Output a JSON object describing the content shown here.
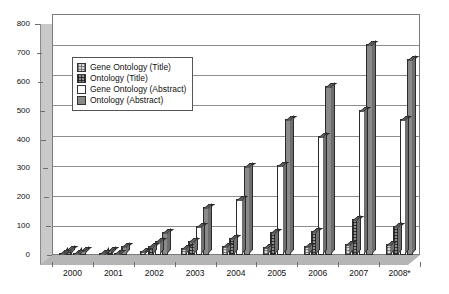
{
  "chart_data": {
    "type": "bar",
    "title": "",
    "xlabel": "",
    "ylabel": "",
    "ylim": [
      0,
      800
    ],
    "ytick_step": 100,
    "yticks": [
      "800",
      "700",
      "600",
      "500",
      "400",
      "300",
      "200",
      "100",
      "0"
    ],
    "grid": true,
    "legend_position": "upper-left-inside",
    "categories": [
      "2000",
      "2001",
      "2002",
      "2003",
      "2004",
      "2005",
      "2006",
      "2007",
      "2008*"
    ],
    "series": [
      {
        "name": "Gene Ontology (Title)",
        "fill": "light-checker",
        "values": [
          6,
          5,
          12,
          22,
          30,
          28,
          30,
          38,
          35
        ]
      },
      {
        "name": "Ontology (Title)",
        "fill": "dark-checker",
        "values": [
          20,
          18,
          30,
          48,
          58,
          78,
          80,
          118,
          95
        ]
      },
      {
        "name": "Gene Ontology (Abstract)",
        "fill": "white",
        "values": [
          5,
          8,
          45,
          95,
          185,
          300,
          395,
          480,
          450
        ]
      },
      {
        "name": "Ontology (Abstract)",
        "fill": "solid-gray",
        "values": [
          15,
          30,
          75,
          160,
          295,
          450,
          560,
          700,
          650
        ]
      }
    ]
  },
  "colors": {
    "axis": "#7a7a7a",
    "gridline": "#8d8d8d",
    "bar_outline": "#2b2b2b",
    "series_light_checker": "#d8d8d8",
    "series_dark_checker": "#8e8e8e",
    "series_white": "#ffffff",
    "series_solid_gray": "#8a8a8a",
    "floor": "#b5b5b5",
    "wall": "#c9c9c9"
  }
}
